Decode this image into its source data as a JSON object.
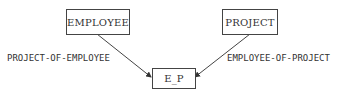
{
  "diagram": {
    "nodes": [
      {
        "id": "employee",
        "label": "EMPLOYEE"
      },
      {
        "id": "project",
        "label": "PROJECT"
      },
      {
        "id": "e_p",
        "label": "E_P"
      }
    ],
    "edges": [
      {
        "from": "employee",
        "to": "e_p",
        "label": "PROJECT-OF-EMPLOYEE"
      },
      {
        "from": "project",
        "to": "e_p",
        "label": "EMPLOYEE-OF-PROJECT"
      }
    ]
  }
}
